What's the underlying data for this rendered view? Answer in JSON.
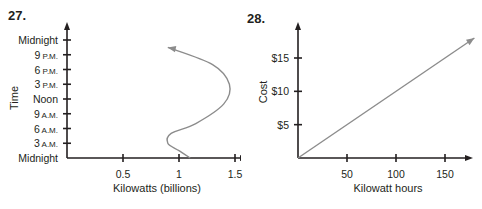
{
  "chart_data": [
    {
      "id": "27",
      "number_label": "27.",
      "type": "line",
      "title": "",
      "xlabel": "Kilowatts (billions)",
      "ylabel": "Time",
      "x_ticks": [
        "0.5",
        "1",
        "1.5"
      ],
      "x_tick_values": [
        0.5,
        1,
        1.5
      ],
      "y_ticks": [
        {
          "main": "Midnight",
          "suffix": ""
        },
        {
          "main": "3",
          "suffix": "A.M."
        },
        {
          "main": "6",
          "suffix": "A.M."
        },
        {
          "main": "9",
          "suffix": "A.M."
        },
        {
          "main": "Noon",
          "suffix": ""
        },
        {
          "main": "3",
          "suffix": "P.M."
        },
        {
          "main": "6",
          "suffix": "P.M."
        },
        {
          "main": "9",
          "suffix": "P.M."
        },
        {
          "main": "Midnight",
          "suffix": ""
        }
      ],
      "xlim": [
        0,
        1.6
      ],
      "ylim_hours": [
        0,
        24
      ],
      "grid": false,
      "series": [
        {
          "name": "power usage",
          "x": [
            1.1,
            1.0,
            0.9,
            0.93,
            1.15,
            1.4,
            1.45,
            1.3,
            0.9
          ],
          "y_hours": [
            0,
            1.5,
            3,
            5,
            7,
            11,
            15,
            19,
            22.5
          ],
          "arrow_end": true,
          "color": "#8c8c8c"
        }
      ]
    },
    {
      "id": "28",
      "number_label": "28.",
      "type": "line",
      "title": "",
      "xlabel": "Kilowatt hours",
      "ylabel": "Cost",
      "x_ticks": [
        "50",
        "100",
        "150"
      ],
      "x_tick_values": [
        50,
        100,
        150
      ],
      "y_ticks": [
        "$5",
        "$10",
        "$15"
      ],
      "y_tick_values": [
        5,
        10,
        15
      ],
      "xlim": [
        0,
        180
      ],
      "ylim": [
        0,
        19
      ],
      "grid": false,
      "series": [
        {
          "name": "cost",
          "x": [
            0,
            180
          ],
          "y": [
            0,
            18
          ],
          "arrow_end": true,
          "color": "#8c8c8c"
        }
      ]
    }
  ]
}
